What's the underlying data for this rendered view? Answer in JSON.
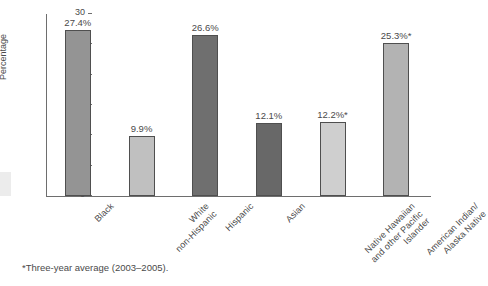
{
  "chart_data": {
    "type": "bar",
    "title": "",
    "xlabel": "",
    "ylabel": "Percentage",
    "ylim": [
      0,
      30
    ],
    "ytick_values": [
      0,
      5,
      10,
      15,
      20,
      25,
      30
    ],
    "ytick_labels": [
      "0",
      "5",
      "10",
      "15",
      "20",
      "25",
      "30"
    ],
    "grid": false,
    "legend": "none",
    "categories": [
      "Black",
      "White\nnon-Hispanic",
      "Hispanic",
      "Asian",
      "Native Hawaiian\nand other Pacific\nIslander",
      "American Indian/\nAlaska Native"
    ],
    "values": [
      27.4,
      9.9,
      26.6,
      12.1,
      12.2,
      25.3
    ],
    "data_labels": [
      "27.4%",
      "9.9%",
      "26.6%",
      "12.1%",
      "12.2%*",
      "25.3%*"
    ],
    "bar_colors": [
      "#949494",
      "#c0c0c0",
      "#6f6f6f",
      "#686868",
      "#cfcfcf",
      "#b3b3b3"
    ],
    "annotations": [
      "*Three-year average (2003–2005)."
    ]
  },
  "axis": {
    "y_title": "Percentage",
    "ticks": [
      {
        "label": "30",
        "value": 30
      },
      {
        "label": "25",
        "value": 25
      },
      {
        "label": "20",
        "value": 20
      },
      {
        "label": "15",
        "value": 15
      },
      {
        "label": "10",
        "value": 10
      },
      {
        "label": "5",
        "value": 5
      },
      {
        "label": "0",
        "value": 0
      }
    ]
  },
  "bars": [
    {
      "label": "Black",
      "label_lines": [
        "Black"
      ],
      "value": 27.4,
      "data_label": "27.4%",
      "color": "#949494"
    },
    {
      "label": "White non-Hispanic",
      "label_lines": [
        "White",
        "non-Hispanic"
      ],
      "value": 9.9,
      "data_label": "9.9%",
      "color": "#c0c0c0"
    },
    {
      "label": "Hispanic",
      "label_lines": [
        "Hispanic"
      ],
      "value": 26.6,
      "data_label": "26.6%",
      "color": "#6f6f6f"
    },
    {
      "label": "Asian",
      "label_lines": [
        "Asian"
      ],
      "value": 12.1,
      "data_label": "12.1%",
      "color": "#686868"
    },
    {
      "label": "Native Hawaiian and other Pacific Islander",
      "label_lines": [
        "Native Hawaiian",
        "and other Pacific",
        "Islander"
      ],
      "value": 12.2,
      "data_label": "12.2%*",
      "color": "#cfcfcf"
    },
    {
      "label": "American Indian/Alaska Native",
      "label_lines": [
        "American Indian/",
        "Alaska Native"
      ],
      "value": 25.3,
      "data_label": "25.3%*",
      "color": "#b3b3b3"
    }
  ],
  "footnote": {
    "text": "*Three-year average (2003–2005)."
  }
}
